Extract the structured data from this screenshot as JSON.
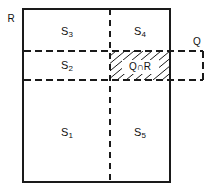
{
  "figure": {
    "background_color": "#ffffff",
    "line_color": "#1a1a1a",
    "hatch_color": "#1a1a1a"
  },
  "outer_region": {
    "label": "R",
    "label_x": 11,
    "label_y": 19,
    "rect": {
      "x": 23,
      "y": 9,
      "width": 147,
      "height": 173
    },
    "stroke_width": 2,
    "style": "solid"
  },
  "query_region": {
    "label": "Q",
    "label_x": 197,
    "label_y": 42,
    "rect": {
      "x": 24,
      "y": 51,
      "width": 179,
      "height": 29
    },
    "stroke_width": 2,
    "style": "dashed",
    "dash_pattern": "7,4"
  },
  "dividers": [
    {
      "name": "vertical-divider",
      "orientation": "vertical",
      "x": 110,
      "y1": 9,
      "y2": 182,
      "style": "dashed",
      "dash_pattern": "6,5",
      "stroke_width": 2
    },
    {
      "name": "horizontal-divider-upper",
      "orientation": "horizontal",
      "y": 51,
      "x1": 24,
      "x2": 203,
      "style": "dashed",
      "dash_pattern": "7,4",
      "stroke_width": 2
    },
    {
      "name": "horizontal-divider-lower",
      "orientation": "horizontal",
      "y": 80,
      "x1": 24,
      "x2": 203,
      "style": "dashed",
      "dash_pattern": "7,4",
      "stroke_width": 2
    }
  ],
  "regions": [
    {
      "id": "s3",
      "base": "S",
      "subscript": "3",
      "x": 67,
      "y": 32
    },
    {
      "id": "s4",
      "base": "S",
      "subscript": "4",
      "x": 140,
      "y": 32
    },
    {
      "id": "s2",
      "base": "S",
      "subscript": "2",
      "x": 67,
      "y": 66
    },
    {
      "id": "s1",
      "base": "S",
      "subscript": "1",
      "x": 67,
      "y": 133
    },
    {
      "id": "s5",
      "base": "S",
      "subscript": "5",
      "x": 140,
      "y": 133
    }
  ],
  "intersection": {
    "label": "Q∩R",
    "label_x": 140,
    "label_y": 67,
    "area": {
      "x": 110,
      "y": 51,
      "width": 60,
      "height": 29
    },
    "hatch": {
      "direction": "lower-left-to-upper-right",
      "line_count": 8,
      "spacing": 9,
      "stroke_width": 1
    }
  }
}
